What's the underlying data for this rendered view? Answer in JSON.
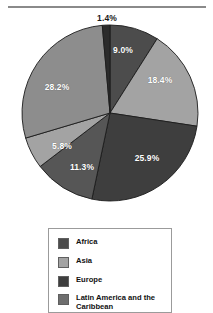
{
  "figure": {
    "has_top_rule": true,
    "background_color": "#ffffff"
  },
  "chart_data": {
    "type": "pie",
    "title": "",
    "subtitle": "",
    "xlabel": "",
    "ylabel": "",
    "grid": false,
    "legend_position": "bottom",
    "value_suffix": "%",
    "start_angle_deg": 0,
    "direction": "clockwise",
    "categories": [
      "Africa",
      "Asia",
      "Europe",
      "Latin America and the Caribbean",
      "Northern America",
      "Oceania",
      "Other"
    ],
    "slices": [
      {
        "id": "slice-9",
        "label": "9.0%",
        "value": 9.0,
        "color": "#4c4c4c",
        "label_x": 123,
        "label_y": 50,
        "label_outside": false
      },
      {
        "id": "slice-18-4",
        "label": "18.4%",
        "value": 18.4,
        "color": "#a3a3a3",
        "label_x": 160,
        "label_y": 80,
        "label_outside": false
      },
      {
        "id": "slice-25-9",
        "label": "25.9%",
        "value": 25.9,
        "color": "#3e3e3e",
        "label_x": 147,
        "label_y": 158,
        "label_outside": false
      },
      {
        "id": "slice-11-3",
        "label": "11.3%",
        "value": 11.3,
        "color": "#565656",
        "label_x": 82,
        "label_y": 167,
        "label_outside": false
      },
      {
        "id": "slice-5-8",
        "label": "5.8%",
        "value": 5.8,
        "color": "#a3a3a3",
        "label_x": 62,
        "label_y": 146,
        "label_outside": false
      },
      {
        "id": "slice-28-2",
        "label": "28.2%",
        "value": 28.2,
        "color": "#8d8d8d",
        "label_x": 57,
        "label_y": 87,
        "label_outside": false
      },
      {
        "id": "slice-1-4",
        "label": "1.4%",
        "value": 1.4,
        "color": "#2b2b2b",
        "label_x": 107,
        "label_y": 18,
        "label_outside": true
      }
    ],
    "legend_entries": [
      {
        "label": "Africa",
        "color": "#4c4c4c"
      },
      {
        "label": "Asia",
        "color": "#a3a3a3"
      },
      {
        "label": "Europe",
        "color": "#3e3e3e"
      },
      {
        "label": "Latin America and the Caribbean",
        "color": "#6e6e6e"
      }
    ]
  }
}
